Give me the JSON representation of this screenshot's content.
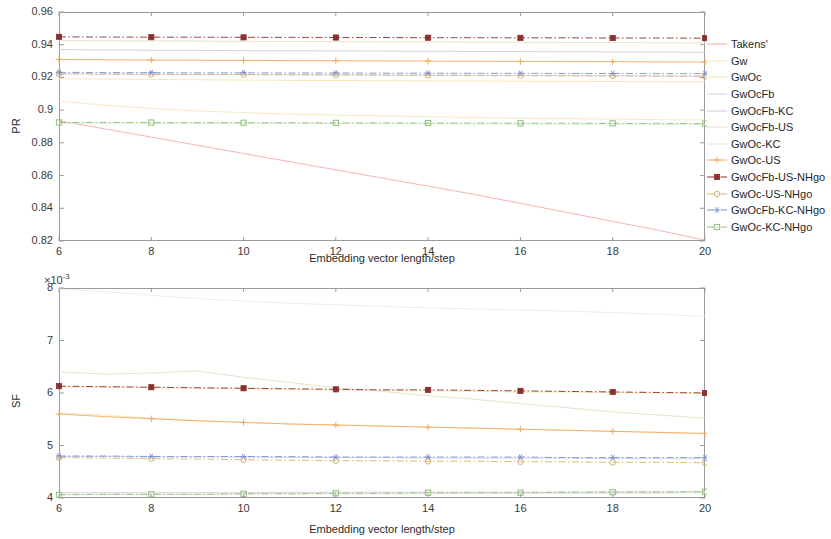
{
  "legend": {
    "position": "right",
    "entries": [
      {
        "label": "Takens'",
        "color": "#f4a9a9",
        "marker": "none",
        "style": "solid"
      },
      {
        "label": "Gw",
        "color": "#f7e7bb",
        "marker": "none",
        "style": "solid"
      },
      {
        "label": "GwOc",
        "color": "#f6e3ae",
        "marker": "none",
        "style": "solid"
      },
      {
        "label": "GwOcFb",
        "color": "#cdd3e8",
        "marker": "none",
        "style": "solid"
      },
      {
        "label": "GwOcFb-KC",
        "color": "#d9c7e0",
        "marker": "none",
        "style": "solid"
      },
      {
        "label": "GwOcFb-US",
        "color": "#e8dcc6",
        "marker": "none",
        "style": "solid"
      },
      {
        "label": "GwOc-KC",
        "color": "#dbe6d2",
        "marker": "none",
        "style": "solid"
      },
      {
        "label": "GwOc-US",
        "color": "#f0a95e",
        "marker": "plus",
        "style": "solid"
      },
      {
        "label": "GwOcFb-US-NHgo",
        "color": "#8b2f2f",
        "marker": "filled-square",
        "style": "dashdot"
      },
      {
        "label": "GwOc-US-NHgo",
        "color": "#d8b26a",
        "marker": "circle",
        "style": "dashdot"
      },
      {
        "label": "GwOcFb-KC-NHgo",
        "color": "#7b8fd4",
        "marker": "asterisk",
        "style": "dashdot"
      },
      {
        "label": "GwOc-KC-NHgo",
        "color": "#8fbf7a",
        "marker": "square",
        "style": "dashdot"
      }
    ]
  },
  "chart_data": [
    {
      "type": "line",
      "id": "pr-chart",
      "title": "",
      "xlabel": "Embedding vector length/step",
      "ylabel": "PR",
      "x": [
        6,
        7,
        8,
        9,
        10,
        11,
        12,
        13,
        14,
        15,
        16,
        17,
        18,
        19,
        20
      ],
      "xlim": [
        6,
        20
      ],
      "xticks": [
        6,
        8,
        10,
        12,
        14,
        16,
        18,
        20
      ],
      "ylim": [
        0.82,
        0.96
      ],
      "yticks": [
        0.82,
        0.84,
        0.86,
        0.88,
        0.9,
        0.92,
        0.94,
        0.96
      ],
      "grid": false,
      "series": [
        {
          "name": "Takens'",
          "color": "#f4a9a9",
          "marker": "none",
          "style": "solid",
          "values": [
            0.8935,
            0.8885,
            0.8835,
            0.8785,
            0.8735,
            0.8685,
            0.8635,
            0.8585,
            0.8535,
            0.8485,
            0.843,
            0.8375,
            0.832,
            0.8265,
            0.8205
          ]
        },
        {
          "name": "Gw",
          "color": "#f7e7bb",
          "marker": "none",
          "style": "solid",
          "values": [
            0.9055,
            0.903,
            0.901,
            0.8995,
            0.8985,
            0.8975,
            0.897,
            0.8965,
            0.896,
            0.8955,
            0.895,
            0.8948,
            0.8945,
            0.8942,
            0.894
          ]
        },
        {
          "name": "GwOc",
          "color": "#f6e3ae",
          "marker": "none",
          "style": "solid",
          "values": [
            0.9192,
            0.919,
            0.9188,
            0.9186,
            0.9184,
            0.9182,
            0.9181,
            0.918,
            0.9179,
            0.9178,
            0.9177,
            0.9176,
            0.9175,
            0.9174,
            0.9173
          ]
        },
        {
          "name": "GwOcFb",
          "color": "#cdd3e8",
          "marker": "none",
          "style": "solid",
          "values": [
            0.9222,
            0.9221,
            0.922,
            0.9219,
            0.9218,
            0.9217,
            0.9216,
            0.9215,
            0.9214,
            0.9213,
            0.9212,
            0.9211,
            0.921,
            0.9209,
            0.9208
          ]
        },
        {
          "name": "GwOcFb-KC",
          "color": "#d9c7e0",
          "marker": "none",
          "style": "solid",
          "values": [
            0.937,
            0.9368,
            0.9366,
            0.9365,
            0.9364,
            0.9363,
            0.9362,
            0.9361,
            0.936,
            0.9359,
            0.9358,
            0.9357,
            0.9356,
            0.9355,
            0.9354
          ]
        },
        {
          "name": "GwOcFb-US",
          "color": "#e8dcc6",
          "marker": "none",
          "style": "solid",
          "values": [
            0.9425,
            0.9424,
            0.9423,
            0.9422,
            0.9421,
            0.942,
            0.9419,
            0.9418,
            0.9417,
            0.9416,
            0.9415,
            0.9414,
            0.9413,
            0.9412,
            0.9411
          ]
        },
        {
          "name": "GwOc-KC",
          "color": "#dbe6d2",
          "marker": "none",
          "style": "solid",
          "values": [
            0.892,
            0.892,
            0.892,
            0.8919,
            0.8919,
            0.8918,
            0.8918,
            0.8917,
            0.8917,
            0.8916,
            0.8916,
            0.8915,
            0.8915,
            0.8914,
            0.8913
          ]
        },
        {
          "name": "GwOc-US",
          "color": "#f0a95e",
          "marker": "plus",
          "style": "solid",
          "values": [
            0.931,
            0.9308,
            0.9306,
            0.9305,
            0.9304,
            0.9303,
            0.9302,
            0.9301,
            0.93,
            0.9299,
            0.9298,
            0.9297,
            0.9296,
            0.9295,
            0.9294
          ]
        },
        {
          "name": "GwOcFb-US-NHgo",
          "color": "#8b2f2f",
          "marker": "filled-square",
          "style": "dashdot",
          "values": [
            0.9448,
            0.9447,
            0.9446,
            0.9446,
            0.9445,
            0.9445,
            0.9444,
            0.9444,
            0.9443,
            0.9443,
            0.9442,
            0.9442,
            0.9441,
            0.9441,
            0.944
          ]
        },
        {
          "name": "GwOc-US-NHgo",
          "color": "#d8b26a",
          "marker": "circle",
          "style": "dashdot",
          "values": [
            0.9222,
            0.922,
            0.9219,
            0.9218,
            0.9217,
            0.9216,
            0.9215,
            0.9214,
            0.9213,
            0.9212,
            0.9211,
            0.921,
            0.9209,
            0.9208,
            0.9207
          ]
        },
        {
          "name": "GwOcFb-KC-NHgo",
          "color": "#7b8fd4",
          "marker": "asterisk",
          "style": "dashdot",
          "values": [
            0.9231,
            0.923,
            0.9229,
            0.9228,
            0.9228,
            0.9227,
            0.9227,
            0.9226,
            0.9226,
            0.9225,
            0.9225,
            0.9224,
            0.9224,
            0.9223,
            0.9223
          ]
        },
        {
          "name": "GwOc-KC-NHgo",
          "color": "#8fbf7a",
          "marker": "square",
          "style": "dashdot",
          "values": [
            0.8925,
            0.8925,
            0.8924,
            0.8924,
            0.8923,
            0.8923,
            0.8922,
            0.8922,
            0.8921,
            0.8921,
            0.892,
            0.892,
            0.8919,
            0.8919,
            0.8918
          ]
        }
      ]
    },
    {
      "type": "line",
      "id": "sf-chart",
      "title": "",
      "xlabel": "Embedding vector length/step",
      "ylabel": "SF",
      "y_exponent": "×10⁻³",
      "x": [
        6,
        7,
        8,
        9,
        10,
        11,
        12,
        13,
        14,
        15,
        16,
        17,
        18,
        19,
        20
      ],
      "xlim": [
        6,
        20
      ],
      "xticks": [
        6,
        8,
        10,
        12,
        14,
        16,
        18,
        20
      ],
      "ylim": [
        4,
        8
      ],
      "yticks": [
        4,
        5,
        6,
        7,
        8
      ],
      "grid": false,
      "series": [
        {
          "name": "Takens'",
          "color": "#ece8ee",
          "marker": "none",
          "style": "solid",
          "values": [
            7.98,
            7.93,
            7.86,
            7.8,
            7.75,
            7.71,
            7.68,
            7.65,
            7.62,
            7.6,
            7.58,
            7.56,
            7.53,
            7.5,
            7.46
          ]
        },
        {
          "name": "Gw",
          "color": "#f7e7bb",
          "marker": "none",
          "style": "solid",
          "values": [
            5.62,
            5.58,
            5.52,
            5.48,
            5.44,
            5.41,
            5.39,
            5.37,
            5.35,
            5.33,
            5.31,
            5.29,
            5.27,
            5.25,
            5.22
          ]
        },
        {
          "name": "GwOc",
          "color": "#f6e3ae",
          "marker": "none",
          "style": "solid",
          "values": [
            6.12,
            6.11,
            6.1,
            6.09,
            6.08,
            6.07,
            6.06,
            6.05,
            6.04,
            6.03,
            6.02,
            6.02,
            6.01,
            6.0,
            6.0
          ]
        },
        {
          "name": "GwOcFb",
          "color": "#cdd3e8",
          "marker": "none",
          "style": "solid",
          "values": [
            4.79,
            4.79,
            4.78,
            4.78,
            4.78,
            4.77,
            4.77,
            4.77,
            4.76,
            4.76,
            4.76,
            4.76,
            4.75,
            4.75,
            4.75
          ]
        },
        {
          "name": "GwOcFb-KC",
          "color": "#d9c7e0",
          "marker": "none",
          "style": "solid",
          "values": [
            4.1,
            4.1,
            4.1,
            4.1,
            4.1,
            4.11,
            4.11,
            4.11,
            4.11,
            4.11,
            4.11,
            4.11,
            4.12,
            4.12,
            4.12
          ]
        },
        {
          "name": "GwOcFb-US",
          "color": "#e8dcc6",
          "marker": "none",
          "style": "solid",
          "values": [
            6.4,
            6.36,
            6.38,
            6.42,
            6.3,
            6.2,
            6.1,
            6.03,
            5.95,
            5.88,
            5.8,
            5.72,
            5.64,
            5.58,
            5.52
          ]
        },
        {
          "name": "GwOc-KC",
          "color": "#dbe6d2",
          "marker": "none",
          "style": "solid",
          "values": [
            4.07,
            4.07,
            4.07,
            4.07,
            4.08,
            4.08,
            4.08,
            4.08,
            4.08,
            4.09,
            4.09,
            4.09,
            4.09,
            4.09,
            4.1
          ]
        },
        {
          "name": "GwOc-US",
          "color": "#f0a95e",
          "marker": "plus",
          "style": "solid",
          "values": [
            5.6,
            5.55,
            5.51,
            5.47,
            5.44,
            5.41,
            5.39,
            5.37,
            5.35,
            5.33,
            5.31,
            5.29,
            5.27,
            5.25,
            5.23
          ]
        },
        {
          "name": "GwOcFb-US-NHgo",
          "color": "#8b2f2f",
          "marker": "filled-square",
          "style": "dashdot",
          "values": [
            6.13,
            6.12,
            6.11,
            6.1,
            6.09,
            6.08,
            6.07,
            6.06,
            6.06,
            6.05,
            6.04,
            6.03,
            6.02,
            6.01,
            6.0
          ]
        },
        {
          "name": "GwOc-US-NHgo",
          "color": "#d8b26a",
          "marker": "circle",
          "style": "dashdot",
          "values": [
            4.77,
            4.76,
            4.75,
            4.74,
            4.73,
            4.72,
            4.71,
            4.71,
            4.7,
            4.7,
            4.69,
            4.69,
            4.68,
            4.68,
            4.67
          ]
        },
        {
          "name": "GwOcFb-KC-NHgo",
          "color": "#7b8fd4",
          "marker": "asterisk",
          "style": "dashdot",
          "values": [
            4.8,
            4.8,
            4.79,
            4.79,
            4.79,
            4.79,
            4.78,
            4.78,
            4.78,
            4.78,
            4.78,
            4.77,
            4.77,
            4.77,
            4.77
          ]
        },
        {
          "name": "GwOc-KC-NHgo",
          "color": "#8fbf7a",
          "marker": "square",
          "style": "dashdot",
          "values": [
            4.06,
            4.07,
            4.07,
            4.07,
            4.08,
            4.08,
            4.09,
            4.09,
            4.1,
            4.1,
            4.1,
            4.11,
            4.11,
            4.11,
            4.12
          ]
        }
      ]
    }
  ]
}
